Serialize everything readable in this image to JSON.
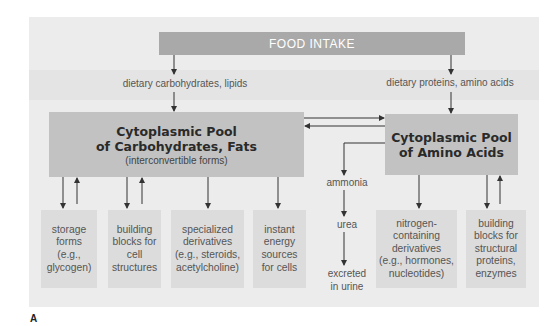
{
  "figure_label": "A",
  "food_intake": "FOOD INTAKE",
  "inputs": {
    "left": "dietary carbohydrates, lipids",
    "right": "dietary proteins, amino acids"
  },
  "pools": {
    "carb": {
      "line1": "Cytoplasmic Pool",
      "line2": "of Carbohydrates, Fats",
      "sub": "(interconvertible forms)"
    },
    "amino": {
      "line1": "Cytoplasmic Pool",
      "line2": "of Amino Acids"
    }
  },
  "nitrogen_path": {
    "ammonia": "ammonia",
    "urea": "urea",
    "excreted_1": "excreted",
    "excreted_2": "in urine"
  },
  "outputs": [
    {
      "lines": [
        "storage",
        "forms",
        "(e.g.,",
        "glycogen)"
      ]
    },
    {
      "lines": [
        "building",
        "blocks for",
        "cell",
        "structures"
      ]
    },
    {
      "lines": [
        "specialized",
        "derivatives",
        "(e.g., steroids,",
        "acetylcholine)"
      ]
    },
    {
      "lines": [
        "instant",
        "energy",
        "sources",
        "for cells"
      ]
    },
    {
      "lines": [
        "nitrogen-",
        "containing",
        "derivatives",
        "(e.g., hormones,",
        "nucleotides)"
      ]
    },
    {
      "lines": [
        "building",
        "blocks for",
        "structural",
        "proteins,",
        "enzymes"
      ]
    }
  ],
  "colors": {
    "panel": "#ececec",
    "food_bar": "#a9a9a9",
    "pool": "#c2c2c2",
    "leaf": "#dcdcdc",
    "arrow": "#333333"
  }
}
